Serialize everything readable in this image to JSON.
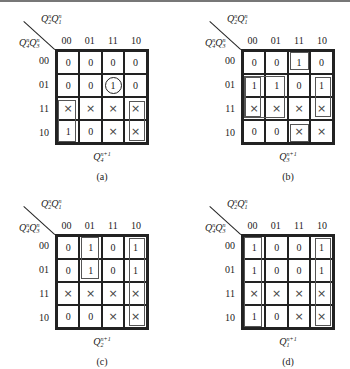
{
  "figure": {
    "col_var": {
      "base": "Q",
      "parts": [
        {
          "sub": "2",
          "sup": "n"
        },
        {
          "sub": "1",
          "sup": "n"
        }
      ]
    },
    "row_var": {
      "base": "Q",
      "parts": [
        {
          "sub": "4",
          "sup": "n"
        },
        {
          "sub": "3",
          "sup": "n"
        }
      ]
    },
    "col_headers": [
      "00",
      "01",
      "11",
      "10"
    ],
    "row_headers": [
      "00",
      "01",
      "11",
      "10"
    ],
    "maps": [
      {
        "id": "a",
        "caption": "(a)",
        "output": {
          "base": "Q",
          "sub": "4",
          "sup": "n+1"
        },
        "cells": [
          [
            "0",
            "0",
            "0",
            "0"
          ],
          [
            "0",
            "0",
            "1",
            "0"
          ],
          [
            "×",
            "×",
            "×",
            "×"
          ],
          [
            "1",
            "0",
            "×",
            "×"
          ]
        ],
        "circled": [
          [
            1,
            2
          ]
        ],
        "loops": [
          {
            "row": 2,
            "col": 0,
            "rows": 2,
            "cols": 1
          },
          {
            "row": 2,
            "col": 3,
            "rows": 2,
            "cols": 1
          }
        ]
      },
      {
        "id": "b",
        "caption": "(b)",
        "output": {
          "base": "Q",
          "sub": "3",
          "sup": "n+1"
        },
        "cells": [
          [
            "0",
            "0",
            "1",
            "0"
          ],
          [
            "1",
            "1",
            "0",
            "1"
          ],
          [
            "×",
            "×",
            "×",
            "×"
          ],
          [
            "0",
            "0",
            "×",
            "×"
          ]
        ],
        "circled": [],
        "loops": [
          {
            "row": 0,
            "col": 2,
            "rows": 1,
            "cols": 1
          },
          {
            "row": 1,
            "col": 0,
            "rows": 2,
            "cols": 1
          },
          {
            "row": 1,
            "col": 0,
            "rows": 2,
            "cols": 2
          },
          {
            "row": 1,
            "col": 3,
            "rows": 2,
            "cols": 1
          },
          {
            "row": 3,
            "col": 2,
            "rows": 1,
            "cols": 1
          }
        ]
      },
      {
        "id": "c",
        "caption": "(c)",
        "output": {
          "base": "Q",
          "sub": "2",
          "sup": "n+1"
        },
        "cells": [
          [
            "0",
            "1",
            "0",
            "1"
          ],
          [
            "0",
            "1",
            "0",
            "1"
          ],
          [
            "×",
            "×",
            "×",
            "×"
          ],
          [
            "0",
            "0",
            "×",
            "×"
          ]
        ],
        "circled": [],
        "loops": [
          {
            "row": 0,
            "col": 1,
            "rows": 2,
            "cols": 1
          },
          {
            "row": 0,
            "col": 3,
            "rows": 4,
            "cols": 1
          }
        ]
      },
      {
        "id": "d",
        "caption": "(d)",
        "output": {
          "base": "Q",
          "sub": "1",
          "sup": "n+1"
        },
        "cells": [
          [
            "1",
            "0",
            "0",
            "1"
          ],
          [
            "1",
            "0",
            "0",
            "1"
          ],
          [
            "×",
            "×",
            "×",
            "×"
          ],
          [
            "1",
            "0",
            "×",
            "×"
          ]
        ],
        "circled": [],
        "loops": [
          {
            "row": 0,
            "col": 0,
            "rows": 4,
            "cols": 1
          },
          {
            "row": 0,
            "col": 3,
            "rows": 4,
            "cols": 1
          }
        ]
      }
    ]
  }
}
